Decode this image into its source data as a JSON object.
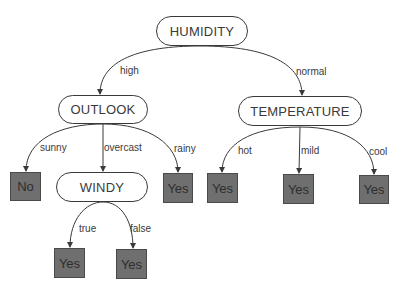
{
  "diagram": {
    "type": "decision-tree",
    "colors": {
      "node_border": "#3a3a3a",
      "node_fill": "#ffffff",
      "leaf_fill": "#6f6f6f",
      "text": "#3a3a3a"
    },
    "nodes": {
      "humidity": "HUMIDITY",
      "outlook": "OUTLOOK",
      "temperature": "TEMPERATURE",
      "windy": "WINDY"
    },
    "leaves": {
      "outlook_sunny": "No",
      "outlook_rainy": "Yes",
      "windy_true": "Yes",
      "windy_false": "Yes",
      "temperature_hot": "Yes",
      "temperature_mild": "Yes",
      "temperature_cool": "Yes"
    },
    "edges": {
      "humidity_high": "high",
      "humidity_normal": "normal",
      "outlook_sunny": "sunny",
      "outlook_overcast": "overcast",
      "outlook_rainy": "rainy",
      "windy_true": "true",
      "windy_false": "false",
      "temperature_hot": "hot",
      "temperature_mild": "mild",
      "temperature_cool": "cool"
    }
  }
}
